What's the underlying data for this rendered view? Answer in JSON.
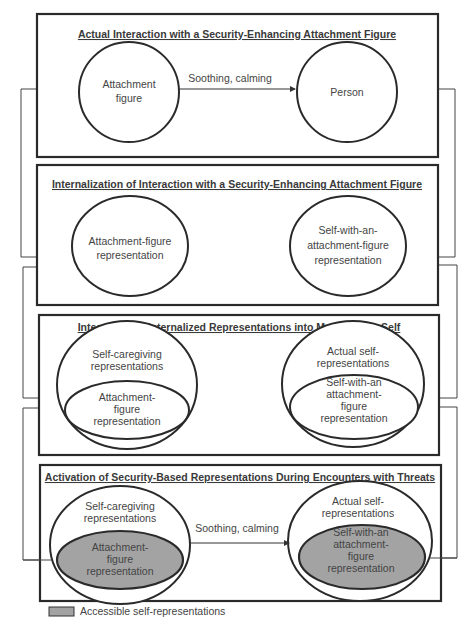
{
  "colors": {
    "stroke": "#2a2a2a",
    "accessible_fill": "#a3a3a3",
    "connector": "#444444"
  },
  "panels": [
    {
      "title": "Actual Interaction with a Security-Enhancing Attachment Figure",
      "left_node": [
        "Attachment",
        "figure"
      ],
      "right_node": [
        "Person"
      ],
      "arrow_label": "Soothing, calming"
    },
    {
      "title": "Internalization of Interaction with a Security-Enhancing Attachment Figure",
      "left_node": [
        "Attachment-figure",
        "representation"
      ],
      "right_node": [
        "Self-with-an-",
        "attachment-figure",
        "representation"
      ]
    },
    {
      "title": "Integration of Internalized Representations into Model of the Self",
      "left_outer": [
        "Self-caregiving",
        "representations"
      ],
      "left_inner": [
        "Attachment-",
        "figure",
        "representation"
      ],
      "right_outer": [
        "Actual self-",
        "representations"
      ],
      "right_inner": [
        "Self-with-an",
        "attachment-",
        "figure",
        "representation"
      ]
    },
    {
      "title": "Activation of Security-Based Representations During Encounters with Threats",
      "left_outer": [
        "Self-caregiving",
        "representations"
      ],
      "left_inner": [
        "Attachment-",
        "figure",
        "representation"
      ],
      "right_outer": [
        "Actual self-",
        "representations"
      ],
      "right_inner": [
        "Self-with-an",
        "attachment-",
        "figure",
        "representation"
      ],
      "arrow_label": "Soothing, calming"
    }
  ],
  "legend": {
    "label": "Accessible self-representations"
  }
}
